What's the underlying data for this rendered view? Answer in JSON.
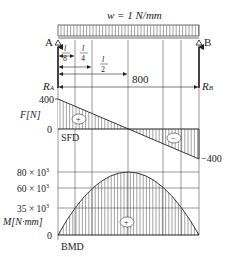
{
  "load": {
    "label": "w = 1 N/mm"
  },
  "supports": {
    "left": "A",
    "right": "B"
  },
  "reactions": {
    "left": "R",
    "left_sub": "A",
    "right": "R",
    "right_sub": "B"
  },
  "dimensions": {
    "l8": {
      "num": "l",
      "den": "8"
    },
    "l4": {
      "num": "l",
      "den": "4"
    },
    "l2": {
      "num": "l",
      "den": "2"
    },
    "span": "800"
  },
  "sfd": {
    "axis_label": "F[N]",
    "ticks": {
      "top": "400",
      "zero": "0",
      "bottom": "−400"
    },
    "name": "SFD",
    "pos_sign": "+",
    "neg_sign": "−"
  },
  "bmd": {
    "axis_label": "M[N·mm]",
    "ticks": [
      {
        "base": "80 × 10",
        "exp": "3"
      },
      {
        "base": "60 × 10",
        "exp": "3"
      },
      {
        "base": "35 × 10",
        "exp": "3"
      }
    ],
    "zero": "0",
    "name": "BMD",
    "pos_sign": "+"
  },
  "chart_data": [
    {
      "type": "line",
      "title": "SFD",
      "xlabel": "x [mm]",
      "ylabel": "F[N]",
      "x": [
        0,
        100,
        200,
        400,
        600,
        700,
        800
      ],
      "values": [
        400,
        300,
        200,
        0,
        -200,
        -300,
        -400
      ],
      "ylim": [
        -400,
        400
      ]
    },
    {
      "type": "area",
      "title": "BMD",
      "xlabel": "x [mm]",
      "ylabel": "M[N·mm]",
      "x": [
        0,
        100,
        200,
        400,
        600,
        700,
        800
      ],
      "values": [
        0,
        35000,
        60000,
        80000,
        60000,
        35000,
        0
      ],
      "ylim": [
        0,
        80000
      ]
    }
  ]
}
